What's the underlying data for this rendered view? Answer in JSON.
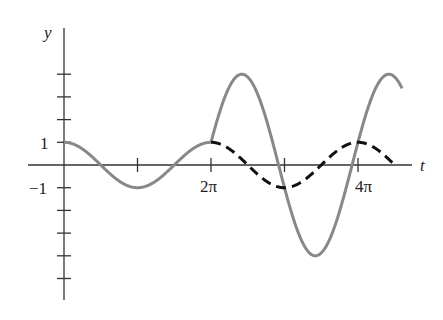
{
  "chart_data": {
    "type": "line",
    "title": "",
    "xlabel": "t",
    "ylabel": "y",
    "x_ticks": [
      {
        "value": "pi",
        "label": ""
      },
      {
        "value": "2pi",
        "label": "2π"
      },
      {
        "value": "3pi",
        "label": ""
      },
      {
        "value": "4pi",
        "label": "4π"
      }
    ],
    "y_ticks": [
      {
        "value": 4,
        "label": ""
      },
      {
        "value": 3,
        "label": ""
      },
      {
        "value": 2,
        "label": ""
      },
      {
        "value": 1,
        "label": "1"
      },
      {
        "value": -1,
        "label": "−1"
      },
      {
        "value": -2,
        "label": ""
      },
      {
        "value": -3,
        "label": ""
      },
      {
        "value": -4,
        "label": ""
      },
      {
        "value": -5,
        "label": ""
      }
    ],
    "xlim": [
      "0",
      "4.6π"
    ],
    "ylim": [
      -5.9,
      5.3
    ],
    "grid": false,
    "series": [
      {
        "name": "solid gray curve",
        "style": "solid",
        "color": "#888888",
        "description": "y = cos t for 0 ≤ t ≤ 2π, then oscillation of amplitude ≈4 starting at (2π, 1)",
        "points": [
          [
            0,
            1
          ],
          [
            1.0,
            -1
          ],
          [
            2.0,
            1
          ],
          [
            2.42,
            4
          ],
          [
            3.42,
            -4
          ],
          [
            4.42,
            4
          ],
          [
            4.6,
            3.4
          ]
        ],
        "x_unit": "π"
      },
      {
        "name": "dashed black curve",
        "style": "dashed",
        "color": "#111111",
        "description": "y = cos t continued for t ≥ 2π",
        "points": [
          [
            2.0,
            1
          ],
          [
            3.0,
            -1
          ],
          [
            4.0,
            1
          ],
          [
            4.5,
            0
          ]
        ],
        "x_unit": "π"
      }
    ]
  },
  "labels": {
    "y_axis": "y",
    "t_axis": "t",
    "one": "1",
    "minus_one": "−1",
    "two_pi": "2π",
    "four_pi": "4π"
  }
}
